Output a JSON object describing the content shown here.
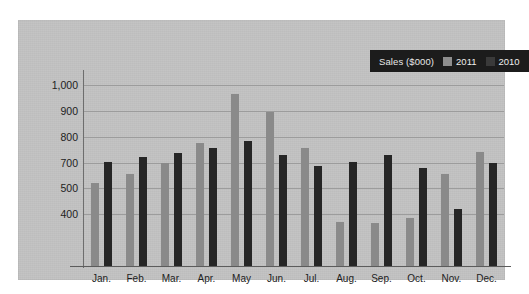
{
  "chart_data": {
    "type": "bar",
    "title": "",
    "subtitle": "",
    "xlabel": "",
    "ylabel": "",
    "legend_title": "Sales ($000)",
    "legend_position": "top-right",
    "grid": true,
    "ylim": [
      300,
      1050
    ],
    "ytick_labels": [
      "1,000",
      "900",
      "800",
      "700",
      "500",
      "400"
    ],
    "ytick_values": [
      1000,
      900,
      800,
      700,
      600,
      500
    ],
    "categories": [
      "Jan.",
      "Feb.",
      "Mar.",
      "Apr.",
      "May",
      "Jun.",
      "Jul.",
      "Aug.",
      "Sep.",
      "Oct.",
      "Nov.",
      "Dec."
    ],
    "series": [
      {
        "name": "2011",
        "color": "#8a8a8a",
        "values": [
          620,
          655,
          700,
          775,
          965,
          895,
          757,
          470,
          465,
          487,
          655,
          742
        ]
      },
      {
        "name": "2010",
        "color": "#262626",
        "values": [
          703,
          723,
          737,
          757,
          783,
          730,
          687,
          703,
          730,
          677,
          520,
          697
        ]
      }
    ]
  },
  "legend": {
    "title": "Sales ($000)",
    "entries": [
      {
        "label": "2011",
        "swatch": "light-gray-swatch"
      },
      {
        "label": "2010",
        "swatch": "dark-swatch"
      }
    ]
  },
  "colors": {
    "panel_background": "#c3c3c3",
    "page_background": "#ffffff",
    "gridline": "#9c9c9c",
    "axis_line": "#5c5c5c",
    "legend_background": "#1c1c1c",
    "legend_text": "#ededed",
    "series_2011": "#8a8a8a",
    "series_2010": "#262626",
    "tick_text": "#1d1d1d"
  }
}
